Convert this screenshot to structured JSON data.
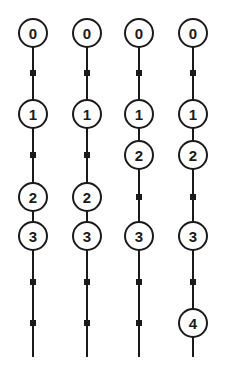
{
  "diagram": {
    "stroke_color": "#1a1a1a",
    "background": "#ffffff",
    "node_radius": 14,
    "line_top": 33,
    "line_bottom": 357,
    "columns": [
      {
        "x": 33,
        "nodes": [
          {
            "label": "0",
            "y": 33
          },
          {
            "label": "1",
            "y": 114
          },
          {
            "label": "2",
            "y": 197
          },
          {
            "label": "3",
            "y": 236
          }
        ],
        "markers": [
          73,
          155,
          282,
          323
        ]
      },
      {
        "x": 87,
        "nodes": [
          {
            "label": "0",
            "y": 33
          },
          {
            "label": "1",
            "y": 114
          },
          {
            "label": "2",
            "y": 197
          },
          {
            "label": "3",
            "y": 236
          }
        ],
        "markers": [
          73,
          155,
          282,
          323
        ]
      },
      {
        "x": 139,
        "nodes": [
          {
            "label": "0",
            "y": 33
          },
          {
            "label": "1",
            "y": 114
          },
          {
            "label": "2",
            "y": 155
          },
          {
            "label": "3",
            "y": 236
          }
        ],
        "markers": [
          73,
          197,
          282,
          323
        ]
      },
      {
        "x": 193,
        "nodes": [
          {
            "label": "0",
            "y": 33
          },
          {
            "label": "1",
            "y": 114
          },
          {
            "label": "2",
            "y": 155
          },
          {
            "label": "3",
            "y": 236
          },
          {
            "label": "4",
            "y": 323
          }
        ],
        "markers": [
          73,
          197,
          282
        ]
      }
    ]
  }
}
